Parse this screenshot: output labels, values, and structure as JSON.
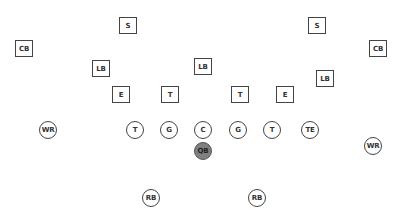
{
  "diagram": {
    "type": "football-formation",
    "colors": {
      "background": "#ffffff",
      "outline": "#444444",
      "qb_fill": "#808080"
    },
    "defense": [
      {
        "label": "S",
        "x": 128,
        "y": 26
      },
      {
        "label": "S",
        "x": 317,
        "y": 26
      },
      {
        "label": "CB",
        "x": 24,
        "y": 49
      },
      {
        "label": "CB",
        "x": 378,
        "y": 49
      },
      {
        "label": "LB",
        "x": 101,
        "y": 69
      },
      {
        "label": "LB",
        "x": 203,
        "y": 67
      },
      {
        "label": "LB",
        "x": 325,
        "y": 79
      },
      {
        "label": "E",
        "x": 121,
        "y": 95
      },
      {
        "label": "T",
        "x": 170,
        "y": 95
      },
      {
        "label": "T",
        "x": 240,
        "y": 95
      },
      {
        "label": "E",
        "x": 285,
        "y": 95
      }
    ],
    "offense": [
      {
        "label": "WR",
        "x": 48,
        "y": 130
      },
      {
        "label": "T",
        "x": 135,
        "y": 130
      },
      {
        "label": "G",
        "x": 169,
        "y": 130
      },
      {
        "label": "C",
        "x": 203,
        "y": 130
      },
      {
        "label": "G",
        "x": 238,
        "y": 130
      },
      {
        "label": "T",
        "x": 272,
        "y": 130
      },
      {
        "label": "TE",
        "x": 310,
        "y": 130
      },
      {
        "label": "QB",
        "x": 203,
        "y": 151,
        "highlight": true
      },
      {
        "label": "WR",
        "x": 373,
        "y": 146
      },
      {
        "label": "RB",
        "x": 151,
        "y": 198
      },
      {
        "label": "RB",
        "x": 257,
        "y": 198
      }
    ]
  }
}
